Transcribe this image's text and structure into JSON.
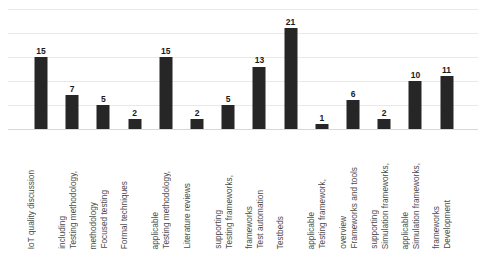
{
  "chart_data": {
    "type": "bar",
    "title": "",
    "subtitle": "",
    "xlabel": "",
    "ylabel": "",
    "ylim": [
      0,
      25
    ],
    "y_gridline_values": [
      0,
      5,
      10,
      15,
      20,
      25
    ],
    "grid": true,
    "legend": false,
    "bar_color": "#262626",
    "gridline_color": "#e9e9e9",
    "background_color": "#ffffff",
    "show_data_labels": true,
    "categories": [
      "IoT quality discussion",
      "Testing methodology, including",
      "Focused testing methodology",
      "Formal techniques",
      "Testing methodology, applicable",
      "Literature reviews",
      "Testing frameworks, supporting",
      "Test automation frameworks",
      "Testbeds",
      "Testing framework, applicable",
      "Frameworks and tools overview",
      "Simulation frameworks, supporting",
      "Simulation frameworks, applicable",
      "Development frameworks"
    ],
    "category_lines": [
      [
        "IoT quality discussion"
      ],
      [
        "Testing methodology,",
        "including"
      ],
      [
        "Focused testing",
        "methodology"
      ],
      [
        "Formal techniques"
      ],
      [
        "Testing methodology,",
        "applicable"
      ],
      [
        "Literature reviews"
      ],
      [
        "Testing frameworks,",
        "supporting"
      ],
      [
        "Test automation",
        "frameworks"
      ],
      [
        "Testbeds"
      ],
      [
        "Testing framework,",
        "applicable"
      ],
      [
        "Frameworks and tools",
        "overview"
      ],
      [
        "Simulation frameworks,",
        "supporting"
      ],
      [
        "Simulation frameworks,",
        "applicable"
      ],
      [
        "Development",
        "frameworks"
      ]
    ],
    "values": [
      15,
      7,
      5,
      2,
      15,
      2,
      5,
      13,
      21,
      1,
      6,
      2,
      10,
      11
    ]
  }
}
